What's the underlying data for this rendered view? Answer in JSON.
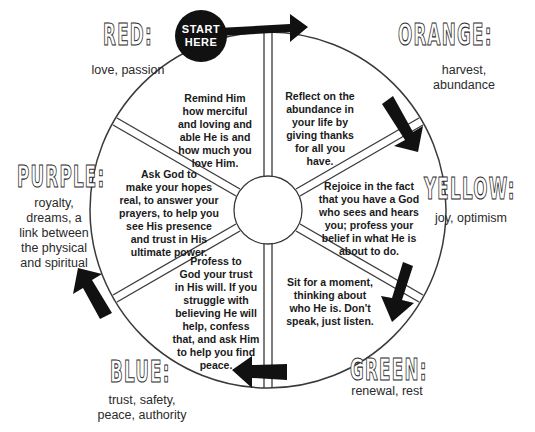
{
  "start_badge": {
    "line1": "START",
    "line2": "HERE"
  },
  "colors": [
    {
      "name": "RED:",
      "meaning": "love, passion"
    },
    {
      "name": "ORANGE:",
      "meaning_lines": [
        "harvest,",
        "abundance"
      ]
    },
    {
      "name": "YELLOW:",
      "meaning": "joy, optimism"
    },
    {
      "name": "GREEN:",
      "meaning": "renewal, rest"
    },
    {
      "name": "BLUE:",
      "meaning_lines": [
        "trust, safety,",
        "peace, authority"
      ]
    },
    {
      "name": "PURPLE:",
      "meaning_lines": [
        "royalty,",
        "dreams, a",
        "link between",
        "the physical",
        "and spiritual"
      ]
    }
  ],
  "segments": [
    {
      "color": "red",
      "lines": [
        "Remind Him",
        "how merciful",
        "and loving and",
        "able He is and",
        "how much you",
        "love Him."
      ]
    },
    {
      "color": "orange",
      "lines": [
        "Reflect on the",
        "abundance in",
        "your life by",
        "giving thanks",
        "for all you",
        "have."
      ]
    },
    {
      "color": "yellow",
      "lines": [
        "Rejoice in the fact",
        "that you have a God",
        "who sees and hears",
        "you; profess your",
        "belief in what He is",
        "about to do."
      ]
    },
    {
      "color": "green",
      "lines": [
        "Sit for a moment,",
        "thinking about",
        "who He is. Don't",
        "speak, just listen."
      ]
    },
    {
      "color": "blue",
      "lines": [
        "Profess to",
        "God your trust",
        "in His will. If you",
        "struggle with",
        "believing He will",
        "help, confess",
        "that, and ask Him",
        "to help you find",
        "peace."
      ]
    },
    {
      "color": "purple",
      "lines": [
        "Ask God to",
        "make your hopes",
        "real, to answer your",
        "prayers, to help you",
        "see His presence",
        "and trust in His",
        "ultimate power."
      ]
    }
  ],
  "style": {
    "ink": "#111111",
    "line": "#3a3a3a",
    "background": "#ffffff"
  }
}
